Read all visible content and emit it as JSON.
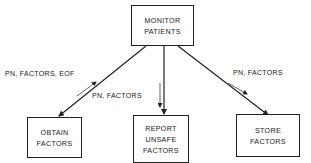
{
  "diagram": {
    "type": "structure-chart",
    "nodes": {
      "root": {
        "lines": [
          "MONITOR",
          "PATIENTS"
        ]
      },
      "obtain": {
        "lines": [
          "OBTAIN",
          "FACTORS"
        ]
      },
      "report": {
        "lines": [
          "REPORT",
          "UNSAFE",
          "FACTORS"
        ]
      },
      "store": {
        "lines": [
          "STORE",
          "FACTORS"
        ]
      }
    },
    "flows": {
      "obtain": {
        "label": "PN, FACTORS, EOF",
        "direction": "up"
      },
      "report": {
        "label": "PN, FACTORS",
        "direction": "down"
      },
      "store": {
        "label": "PN, FACTORS",
        "direction": "down"
      }
    },
    "colors": {
      "line": "#222222",
      "background": "#ffffff",
      "text": "#1a1a1a"
    }
  }
}
